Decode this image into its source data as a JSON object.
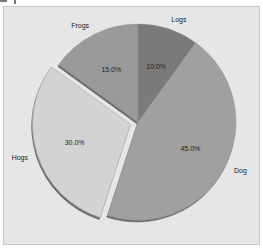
{
  "chart_data": {
    "type": "pie",
    "title": "",
    "categories": [
      "Logs",
      "Dogs",
      "Hogs",
      "Frogs"
    ],
    "values": [
      10.0,
      45.0,
      30.0,
      15.0
    ],
    "labels_pct": [
      "10.0%",
      "45.0%",
      "30.0%",
      "15.0%"
    ],
    "explode": [
      0,
      0,
      0.08,
      0
    ],
    "start_angle": 90,
    "direction": "clockwise",
    "shadow": true,
    "colors": [
      "#7a7a7a",
      "#a0a0a0",
      "#d3d3d3",
      "#9a9a9a"
    ],
    "visible_labels": [
      "Logs",
      "Dog",
      "Hogs",
      "Frogs"
    ]
  },
  "labels": {
    "logs": "Logs",
    "dogs": "Dog",
    "hogs": "Hogs",
    "frogs": "Frogs",
    "logs_pct": "10.0%",
    "dogs_pct": "45.0%",
    "hogs_pct": "30.0%",
    "frogs_pct": "15.0%"
  }
}
